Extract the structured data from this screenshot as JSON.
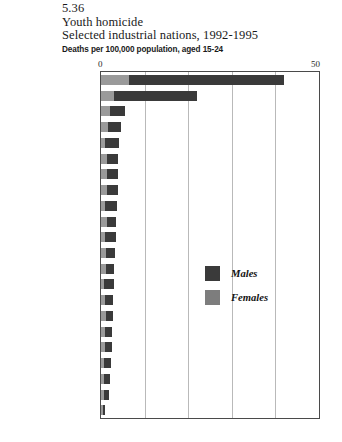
{
  "figure": {
    "number": "5.36",
    "title": "Youth homicide",
    "subtitle": "Selected industrial nations, 1992-1995",
    "units": "Deaths per 100,000 population, aged 15-24",
    "source_note": ""
  },
  "axis": {
    "min_label": "0",
    "max_label": "50"
  },
  "legend": {
    "males_label": "Males",
    "females_label": "Females",
    "males_color": "#3a3a3a",
    "females_color": "#7d7d7d"
  },
  "chart_data": {
    "type": "bar",
    "orientation": "horizontal",
    "stacked": true,
    "title": "Youth homicide",
    "subtitle": "Selected industrial nations, 1992-1995",
    "xlabel": "Deaths per 100,000 population, aged 15-24",
    "ylabel": "",
    "xlim": [
      0,
      50
    ],
    "xticks": [
      0,
      50
    ],
    "gridlines": [
      10,
      20,
      30,
      40
    ],
    "grid": true,
    "legend_position": "inside-center-right",
    "categories": [
      "United States",
      "N. Ireland",
      "New Zealand",
      "Canada",
      "Israel",
      "Switzerland",
      "Australia",
      "Finland",
      "Italy",
      "Portugal",
      "Slovenia",
      "Netherlands",
      "Belgium",
      "Greece",
      "Germany",
      "France",
      "Norway",
      "Sweden",
      "England/Wales",
      "Spain",
      "Austria",
      "Japan"
    ],
    "series": [
      {
        "name": "Females",
        "color": "#9a9a9a",
        "values": [
          6.5,
          3.0,
          2.0,
          1.6,
          1.0,
          1.4,
          1.3,
          1.4,
          0.9,
          1.3,
          1.0,
          1.1,
          1.1,
          0.7,
          1.0,
          1.1,
          1.0,
          1.0,
          0.8,
          0.7,
          0.7,
          0.4
        ]
      },
      {
        "name": "Males",
        "color": "#3a3a3a",
        "values": [
          35.5,
          19.0,
          3.5,
          2.9,
          3.2,
          2.6,
          2.5,
          2.4,
          2.8,
          2.2,
          2.4,
          2.0,
          1.9,
          2.2,
          1.8,
          1.6,
          1.6,
          1.5,
          1.4,
          1.4,
          1.1,
          0.6
        ]
      }
    ],
    "totals": [
      42.0,
      22.0,
      5.5,
      4.5,
      4.2,
      4.0,
      3.8,
      3.8,
      3.7,
      3.5,
      3.4,
      3.1,
      3.0,
      2.9,
      2.8,
      2.7,
      2.6,
      2.5,
      2.2,
      2.1,
      1.8,
      1.0
    ],
    "emphasized_category": "United States"
  }
}
